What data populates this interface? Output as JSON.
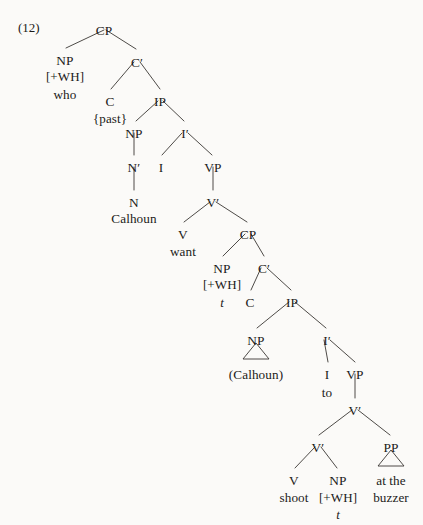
{
  "figure": {
    "example_number": "(12)",
    "example_number_pos": {
      "x": 18,
      "y": 20
    },
    "caption": "",
    "sentence": "who {past} Calhoun want t C to (Calhoun) to shoot t at the buzzer",
    "width": 423,
    "height": 525,
    "background_color": "#fbfaf8",
    "text_color": "#1b1a18",
    "line_color": "#3a3733"
  },
  "nodes": [
    {
      "id": "cp1",
      "label": "CP",
      "kind": "cat",
      "x": 104,
      "y": 24
    },
    {
      "id": "np1",
      "label": "NP",
      "kind": "cat",
      "x": 65,
      "y": 54
    },
    {
      "id": "np1_feat",
      "label": "[+WH]",
      "kind": "feat",
      "x": 65,
      "y": 70
    },
    {
      "id": "np1_word",
      "label": "who",
      "kind": "word",
      "x": 65,
      "y": 88
    },
    {
      "id": "cbar1",
      "label": "C′",
      "kind": "cat",
      "x": 137,
      "y": 56
    },
    {
      "id": "c1",
      "label": "C",
      "kind": "cat",
      "x": 110,
      "y": 95
    },
    {
      "id": "c1_word",
      "label": "{past}",
      "kind": "infl",
      "x": 110,
      "y": 112
    },
    {
      "id": "ip1",
      "label": "IP",
      "kind": "cat",
      "x": 160,
      "y": 95
    },
    {
      "id": "np2",
      "label": "NP",
      "kind": "cat",
      "x": 134,
      "y": 127
    },
    {
      "id": "nbar1",
      "label": "N′",
      "kind": "cat",
      "x": 134,
      "y": 161
    },
    {
      "id": "n1",
      "label": "N",
      "kind": "cat",
      "x": 134,
      "y": 196
    },
    {
      "id": "n1_word",
      "label": "Calhoun",
      "kind": "word",
      "x": 134,
      "y": 212
    },
    {
      "id": "ibar1",
      "label": "I′",
      "kind": "cat",
      "x": 185,
      "y": 127
    },
    {
      "id": "i1",
      "label": "I",
      "kind": "cat",
      "x": 161,
      "y": 161
    },
    {
      "id": "vp1",
      "label": "VP",
      "kind": "cat",
      "x": 213,
      "y": 161
    },
    {
      "id": "vbar1",
      "label": "V′",
      "kind": "cat",
      "x": 213,
      "y": 196
    },
    {
      "id": "v1",
      "label": "V",
      "kind": "cat",
      "x": 183,
      "y": 228
    },
    {
      "id": "v1_word",
      "label": "want",
      "kind": "word",
      "x": 183,
      "y": 245
    },
    {
      "id": "cp2",
      "label": "CP",
      "kind": "cat",
      "x": 248,
      "y": 228
    },
    {
      "id": "np3",
      "label": "NP",
      "kind": "cat",
      "x": 222,
      "y": 262
    },
    {
      "id": "np3_feat",
      "label": "[+WH]",
      "kind": "feat",
      "x": 222,
      "y": 278
    },
    {
      "id": "np3_trace",
      "label": "t",
      "kind": "trace",
      "x": 222,
      "y": 296
    },
    {
      "id": "cbar2",
      "label": "C′",
      "kind": "cat",
      "x": 264,
      "y": 262
    },
    {
      "id": "c2",
      "label": "C",
      "kind": "cat",
      "x": 250,
      "y": 296
    },
    {
      "id": "ip2",
      "label": "IP",
      "kind": "cat",
      "x": 292,
      "y": 296
    },
    {
      "id": "np4",
      "label": "NP",
      "kind": "cat",
      "x": 256,
      "y": 334
    },
    {
      "id": "np4_word",
      "label": "(Calhoun)",
      "kind": "word",
      "x": 256,
      "y": 368
    },
    {
      "id": "ibar2",
      "label": "I′",
      "kind": "cat",
      "x": 327,
      "y": 334
    },
    {
      "id": "i2",
      "label": "I",
      "kind": "cat",
      "x": 327,
      "y": 368
    },
    {
      "id": "i2_word",
      "label": "to",
      "kind": "word",
      "x": 327,
      "y": 386
    },
    {
      "id": "vp2",
      "label": "VP",
      "kind": "cat",
      "x": 355,
      "y": 368
    },
    {
      "id": "vbar2",
      "label": "V′",
      "kind": "cat",
      "x": 355,
      "y": 404
    },
    {
      "id": "vbar3",
      "label": "V′",
      "kind": "cat",
      "x": 318,
      "y": 441
    },
    {
      "id": "pp1",
      "label": "PP",
      "kind": "cat",
      "x": 391,
      "y": 441
    },
    {
      "id": "pp1_w1",
      "label": "at the",
      "kind": "word",
      "x": 391,
      "y": 474
    },
    {
      "id": "pp1_w2",
      "label": "buzzer",
      "kind": "word",
      "x": 391,
      "y": 491
    },
    {
      "id": "v2",
      "label": "V",
      "kind": "cat",
      "x": 294,
      "y": 474
    },
    {
      "id": "v2_word",
      "label": "shoot",
      "kind": "word",
      "x": 294,
      "y": 491
    },
    {
      "id": "np5",
      "label": "NP",
      "kind": "cat",
      "x": 338,
      "y": 474
    },
    {
      "id": "np5_feat",
      "label": "[+WH]",
      "kind": "feat",
      "x": 338,
      "y": 491
    },
    {
      "id": "np5_trace",
      "label": "t",
      "kind": "trace",
      "x": 338,
      "y": 508
    }
  ],
  "branches": [
    {
      "from": "cp1",
      "to": "np1",
      "x1": 104,
      "y1": 30,
      "x2": 66,
      "y2": 48
    },
    {
      "from": "cp1",
      "to": "cbar1",
      "x1": 106,
      "y1": 30,
      "x2": 136,
      "y2": 49
    },
    {
      "from": "cbar1",
      "to": "c1",
      "x1": 134,
      "y1": 62,
      "x2": 111,
      "y2": 89
    },
    {
      "from": "cbar1",
      "to": "ip1",
      "x1": 140,
      "y1": 62,
      "x2": 160,
      "y2": 89
    },
    {
      "from": "ip1",
      "to": "np2",
      "x1": 158,
      "y1": 101,
      "x2": 136,
      "y2": 121
    },
    {
      "from": "ip1",
      "to": "ibar1",
      "x1": 163,
      "y1": 101,
      "x2": 184,
      "y2": 121
    },
    {
      "from": "np2",
      "to": "nbar1",
      "x1": 134,
      "y1": 133,
      "x2": 134,
      "y2": 155
    },
    {
      "from": "nbar1",
      "to": "n1",
      "x1": 134,
      "y1": 167,
      "x2": 134,
      "y2": 190
    },
    {
      "from": "ibar1",
      "to": "i1",
      "x1": 182,
      "y1": 133,
      "x2": 162,
      "y2": 155
    },
    {
      "from": "ibar1",
      "to": "vp1",
      "x1": 188,
      "y1": 133,
      "x2": 212,
      "y2": 155
    },
    {
      "from": "vp1",
      "to": "vbar1",
      "x1": 213,
      "y1": 167,
      "x2": 213,
      "y2": 190
    },
    {
      "from": "vbar1",
      "to": "v1",
      "x1": 210,
      "y1": 202,
      "x2": 184,
      "y2": 222
    },
    {
      "from": "vbar1",
      "to": "cp2",
      "x1": 216,
      "y1": 202,
      "x2": 247,
      "y2": 222
    },
    {
      "from": "cp2",
      "to": "np3",
      "x1": 245,
      "y1": 234,
      "x2": 223,
      "y2": 256
    },
    {
      "from": "cp2",
      "to": "cbar2",
      "x1": 251,
      "y1": 234,
      "x2": 264,
      "y2": 256
    },
    {
      "from": "cbar2",
      "to": "c2",
      "x1": 261,
      "y1": 268,
      "x2": 251,
      "y2": 290
    },
    {
      "from": "cbar2",
      "to": "ip2",
      "x1": 267,
      "y1": 268,
      "x2": 291,
      "y2": 290
    },
    {
      "from": "ip2",
      "to": "np4",
      "x1": 289,
      "y1": 302,
      "x2": 257,
      "y2": 328
    },
    {
      "from": "ip2",
      "to": "ibar2",
      "x1": 295,
      "y1": 302,
      "x2": 326,
      "y2": 328
    },
    {
      "from": "ibar2",
      "to": "i2",
      "x1": 324,
      "y1": 340,
      "x2": 328,
      "y2": 362
    },
    {
      "from": "ibar2",
      "to": "vp2",
      "x1": 330,
      "y1": 340,
      "x2": 355,
      "y2": 362
    },
    {
      "from": "vp2",
      "to": "vbar2",
      "x1": 355,
      "y1": 374,
      "x2": 355,
      "y2": 398
    },
    {
      "from": "vbar2",
      "to": "vbar3",
      "x1": 352,
      "y1": 410,
      "x2": 319,
      "y2": 435
    },
    {
      "from": "vbar2",
      "to": "pp1",
      "x1": 358,
      "y1": 410,
      "x2": 390,
      "y2": 435
    },
    {
      "from": "vbar3",
      "to": "v2",
      "x1": 315,
      "y1": 447,
      "x2": 295,
      "y2": 468
    },
    {
      "from": "vbar3",
      "to": "np5",
      "x1": 321,
      "y1": 447,
      "x2": 337,
      "y2": 468
    }
  ],
  "triangles": [
    {
      "under": "np4",
      "apex_x": 256,
      "apex_y": 343,
      "left_x": 243,
      "right_x": 269,
      "base_y": 359
    },
    {
      "under": "pp1",
      "apex_x": 391,
      "apex_y": 450,
      "left_x": 378,
      "right_x": 404,
      "base_y": 466
    }
  ]
}
